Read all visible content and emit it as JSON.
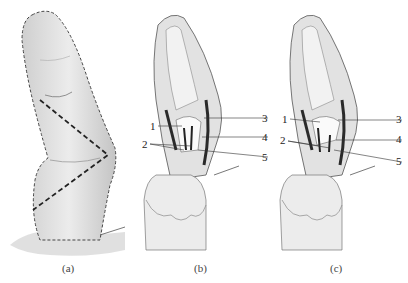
{
  "figure": {
    "panels": [
      {
        "id": "a",
        "caption": "(a)"
      },
      {
        "id": "b",
        "caption": "(b)",
        "labels": [
          "1",
          "2",
          "3",
          "4",
          "5"
        ]
      },
      {
        "id": "c",
        "caption": "(c)",
        "labels": [
          "1",
          "2",
          "3",
          "4",
          "5"
        ]
      }
    ]
  },
  "colors": {
    "skin": "#e6e6e6",
    "skin_shadow": "#bdbdbd",
    "outline": "#555555",
    "incision": "#222222",
    "bone": "#f4f4f4",
    "dark_tissue": "#2a2a2a"
  }
}
